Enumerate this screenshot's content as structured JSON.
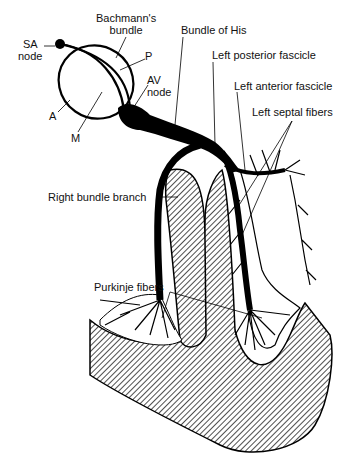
{
  "diagram": {
    "labels": {
      "sa_node": "SA\nnode",
      "sa_node_l1": "SA",
      "sa_node_l2": "node",
      "bachmann_l1": "Bachmann's",
      "bachmann_l2": "bundle",
      "p": "P",
      "av_node_l1": "AV",
      "av_node_l2": "node",
      "a": "A",
      "m": "M",
      "bundle_of_his": "Bundle of His",
      "left_posterior_fascicle": "Left posterior fascicle",
      "left_anterior_fascicle": "Left anterior fascicle",
      "left_septal_fibers": "Left septal fibers",
      "right_bundle_branch": "Right bundle branch",
      "purkinje_fibers": "Purkinje fibers"
    },
    "colors": {
      "ink": "#000000",
      "background": "#ffffff",
      "hatch": "#333333"
    }
  }
}
